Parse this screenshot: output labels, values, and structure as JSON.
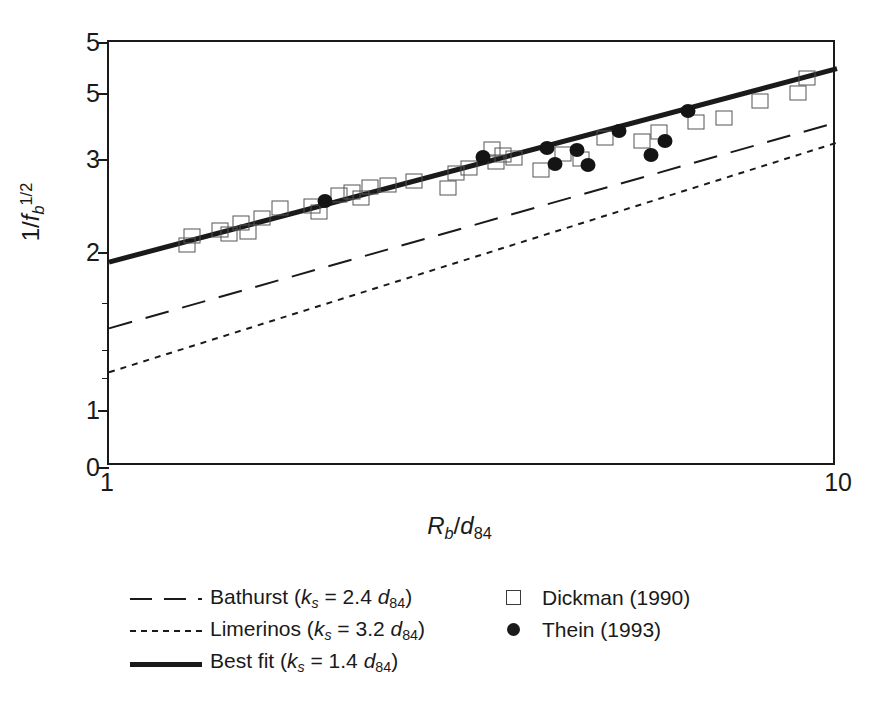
{
  "chart_data": {
    "type": "scatter",
    "title": "",
    "xlabel": "Rb/d84",
    "ylabel": "1/fb^1/2",
    "xscale": "log",
    "yscale": "log",
    "xlim": [
      1,
      10
    ],
    "ylim": [
      1,
      5
    ],
    "grid": false,
    "legend_position": "below-plot",
    "x_ticks": [
      {
        "value": 1,
        "label": "1"
      },
      {
        "value": 10,
        "label": "10"
      }
    ],
    "y_ticks": [
      {
        "value": 5.0,
        "label": "5",
        "minor": false
      },
      {
        "value": 4.0,
        "label": "5",
        "minor": false
      },
      {
        "value": 3.0,
        "label": "3",
        "minor": false
      },
      {
        "value": 2.0,
        "label": "2",
        "minor": false
      },
      {
        "value": 1.6,
        "label": "",
        "minor": true
      },
      {
        "value": 1.3,
        "label": "",
        "minor": true
      },
      {
        "value": 1.15,
        "label": "",
        "minor": true
      },
      {
        "value": 1.0,
        "label": "1",
        "minor": false
      },
      {
        "value": 0.78,
        "label": "0",
        "minor": false
      }
    ],
    "series": [
      {
        "name": "Dickman (1990)",
        "marker": "open-square",
        "points": [
          [
            1.28,
            2.06
          ],
          [
            1.3,
            2.14
          ],
          [
            1.42,
            2.2
          ],
          [
            1.46,
            2.16
          ],
          [
            1.52,
            2.27
          ],
          [
            1.55,
            2.18
          ],
          [
            1.62,
            2.32
          ],
          [
            1.72,
            2.42
          ],
          [
            1.9,
            2.44
          ],
          [
            1.94,
            2.38
          ],
          [
            2.07,
            2.56
          ],
          [
            2.16,
            2.6
          ],
          [
            2.22,
            2.53
          ],
          [
            2.28,
            2.65
          ],
          [
            2.42,
            2.68
          ],
          [
            2.62,
            2.72
          ],
          [
            2.92,
            2.64
          ],
          [
            3.0,
            2.82
          ],
          [
            3.12,
            2.88
          ],
          [
            3.36,
            3.13
          ],
          [
            3.4,
            2.96
          ],
          [
            3.48,
            3.05
          ],
          [
            3.6,
            3.01
          ],
          [
            3.92,
            2.86
          ],
          [
            4.2,
            3.06
          ],
          [
            4.45,
            3.0
          ],
          [
            4.8,
            3.28
          ],
          [
            5.4,
            3.25
          ],
          [
            5.7,
            3.38
          ],
          [
            6.4,
            3.52
          ],
          [
            7.0,
            3.58
          ],
          [
            7.85,
            3.86
          ],
          [
            8.85,
            4.0
          ],
          [
            9.1,
            4.28
          ]
        ]
      },
      {
        "name": "Thein (1993)",
        "marker": "filled-circle",
        "points": [
          [
            1.98,
            2.49
          ],
          [
            3.26,
            3.02
          ],
          [
            4.0,
            3.14
          ],
          [
            4.1,
            2.93
          ],
          [
            4.4,
            3.12
          ],
          [
            4.55,
            2.92
          ],
          [
            5.02,
            3.39
          ],
          [
            5.55,
            3.05
          ],
          [
            5.8,
            3.25
          ],
          [
            6.25,
            3.69
          ]
        ]
      }
    ],
    "lines": [
      {
        "name": "Bathurst (ks = 2.4 d84)",
        "style": "long-dash",
        "points": [
          [
            1,
            1.43
          ],
          [
            10,
            3.52
          ]
        ]
      },
      {
        "name": "Limerinos (ks = 3.2 d84)",
        "style": "dotted",
        "points": [
          [
            1,
            1.18
          ],
          [
            10,
            3.22
          ]
        ]
      },
      {
        "name": "Best fit (ks = 1.4 d84)",
        "style": "solid-thick",
        "points": [
          [
            1,
            1.91
          ],
          [
            10,
            4.45
          ]
        ]
      }
    ]
  },
  "axes": {
    "x_label_left": "1",
    "x_label_right": "10",
    "x_title": {
      "var1": "R",
      "sub1": "b",
      "slash": "/",
      "var2": "d",
      "sub2": "84"
    },
    "y_title": {
      "prefix": "1/",
      "var": "f",
      "sub": "b",
      "sup": "1/2"
    },
    "y_labels": [
      "5",
      "5",
      "3",
      "2",
      "1",
      "0"
    ]
  },
  "legend": {
    "left_entries": [
      {
        "key": "long-dash-line",
        "name": "Bathurst",
        "paren_open": " (",
        "k": "k",
        "ksub": "s",
        "eq": " = ",
        "value": "2.4 ",
        "d": "d",
        "dsub": "84",
        "paren_close": ")"
      },
      {
        "key": "dotted-line",
        "name": "Limerinos",
        "paren_open": " (",
        "k": "k",
        "ksub": "s",
        "eq": " = ",
        "value": "3.2 ",
        "d": "d",
        "dsub": "84",
        "paren_close": ")"
      },
      {
        "key": "solid-thick-line",
        "name": "Best fit",
        "paren_open": " (",
        "k": "k",
        "ksub": "s",
        "eq": " = ",
        "value": "1.4 ",
        "d": "d",
        "dsub": "84",
        "paren_close": ")"
      }
    ],
    "right_entries": [
      {
        "key": "open-square-marker",
        "label": "Dickman (1990)"
      },
      {
        "key": "filled-circle-marker",
        "label": "Thein (1993)"
      }
    ]
  },
  "colors": {
    "ink": "#1a1a1a",
    "marker_outline": "#555555",
    "background": "#ffffff"
  }
}
